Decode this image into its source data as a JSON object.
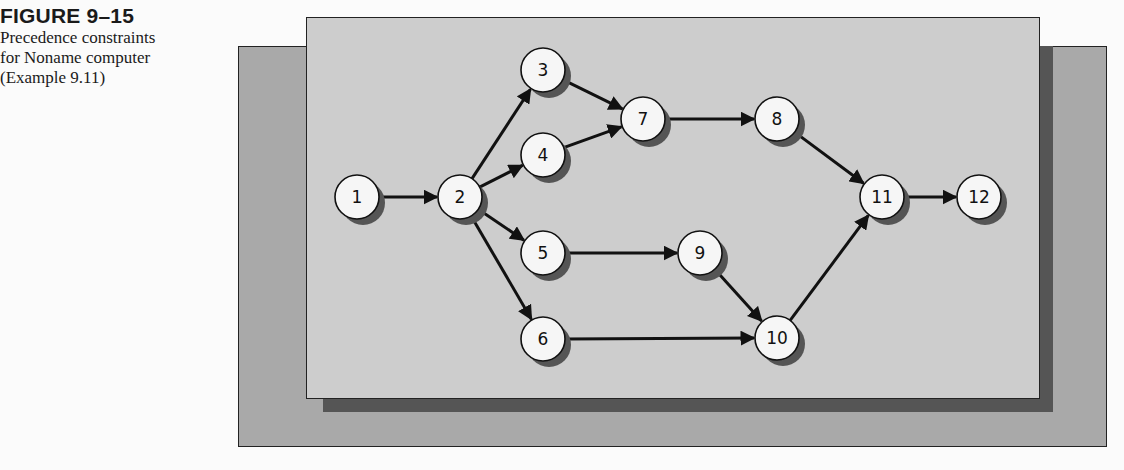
{
  "caption": {
    "figure_number": "FIGURE 9–15",
    "lines": [
      "Precedence constraints",
      "for Noname computer",
      "(Example 9.11)"
    ]
  },
  "diagram": {
    "type": "precedence-network",
    "nodes": [
      {
        "id": "1",
        "x": 357,
        "y": 197
      },
      {
        "id": "2",
        "x": 460,
        "y": 197
      },
      {
        "id": "3",
        "x": 543,
        "y": 70
      },
      {
        "id": "4",
        "x": 543,
        "y": 155
      },
      {
        "id": "5",
        "x": 543,
        "y": 253
      },
      {
        "id": "6",
        "x": 543,
        "y": 339
      },
      {
        "id": "7",
        "x": 643,
        "y": 119
      },
      {
        "id": "8",
        "x": 777,
        "y": 119
      },
      {
        "id": "9",
        "x": 700,
        "y": 253
      },
      {
        "id": "10",
        "x": 777,
        "y": 338
      },
      {
        "id": "11",
        "x": 882,
        "y": 197
      },
      {
        "id": "12",
        "x": 979,
        "y": 197
      }
    ],
    "edges": [
      [
        "1",
        "2"
      ],
      [
        "2",
        "3"
      ],
      [
        "2",
        "4"
      ],
      [
        "2",
        "5"
      ],
      [
        "2",
        "6"
      ],
      [
        "3",
        "7"
      ],
      [
        "4",
        "7"
      ],
      [
        "7",
        "8"
      ],
      [
        "8",
        "11"
      ],
      [
        "5",
        "9"
      ],
      [
        "9",
        "10"
      ],
      [
        "6",
        "10"
      ],
      [
        "10",
        "11"
      ],
      [
        "11",
        "12"
      ]
    ],
    "colors": {
      "front_panel": "#cdcdcd",
      "back_panel": "#a9a9a9",
      "shadow": "#555555",
      "node_fill": "#f6f6f6",
      "stroke": "#111111"
    }
  }
}
